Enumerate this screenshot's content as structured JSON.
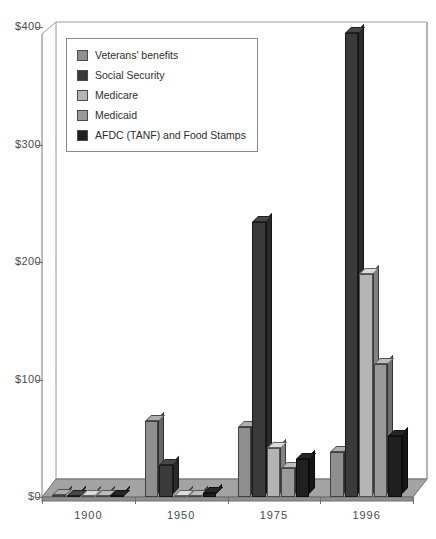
{
  "chart_data": {
    "type": "bar",
    "title": "",
    "subtitle": "",
    "xlabel": "",
    "ylabel": "",
    "categories": [
      "1900",
      "1950",
      "1975",
      "1996"
    ],
    "ylim": [
      0,
      400
    ],
    "yticks": [
      0,
      100,
      200,
      300,
      400
    ],
    "ytick_labels": [
      "$0",
      "$100",
      "$200",
      "$300",
      "$400"
    ],
    "grid": false,
    "legend_position": "upper-left",
    "value_unit": "billions of dollars",
    "series": [
      {
        "name": "Veterans' benefits",
        "color": "#8f8f8f",
        "values": [
          2,
          65,
          60,
          38
        ]
      },
      {
        "name": "Social Security",
        "color": "#3a3a3a",
        "values": [
          0,
          27,
          234,
          395
        ]
      },
      {
        "name": "Medicare",
        "color": "#b4b4b4",
        "values": [
          0,
          0,
          42,
          190
        ]
      },
      {
        "name": "Medicaid",
        "color": "#9a9a9a",
        "values": [
          0,
          0,
          25,
          113
        ]
      },
      {
        "name": "AFDC (TANF) and Food Stamps",
        "color": "#1f1f1f",
        "values": [
          0,
          3,
          32,
          52
        ]
      }
    ]
  },
  "legend": {
    "items": [
      {
        "label": "Veterans' benefits"
      },
      {
        "label": "Social Security"
      },
      {
        "label": "Medicare"
      },
      {
        "label": "Medicaid"
      },
      {
        "label": "AFDC (TANF) and Food Stamps"
      }
    ]
  },
  "colors": {
    "background": "#ffffff",
    "axis": "#787878",
    "floor_top": "#a8a8a8",
    "floor_front": "#8c8c8c",
    "back_wall": "#ffffff",
    "text": "#4a4a4a"
  }
}
